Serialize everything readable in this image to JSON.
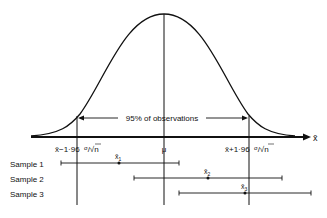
{
  "diagram": {
    "axis_label": "x̄",
    "mean_label": "μ",
    "lower_label_prefix": "x̄−1·96",
    "upper_label_prefix": "x̄+1·96",
    "sigma": "σ",
    "root_n": "n",
    "range_label": "95% of observations",
    "samples": [
      {
        "label": "Sample 1",
        "mean_label": "x̄",
        "subscript": "1",
        "low_x": 61,
        "high_x": 179,
        "mean_x": 119,
        "y": 163
      },
      {
        "label": "Sample 2",
        "mean_label": "x̄",
        "subscript": "2",
        "low_x": 134,
        "high_x": 282,
        "mean_x": 208,
        "y": 178
      },
      {
        "label": "Sample 3",
        "mean_label": "x̄",
        "subscript": "3",
        "low_x": 179,
        "high_x": 311,
        "mean_x": 245,
        "y": 193
      }
    ]
  }
}
